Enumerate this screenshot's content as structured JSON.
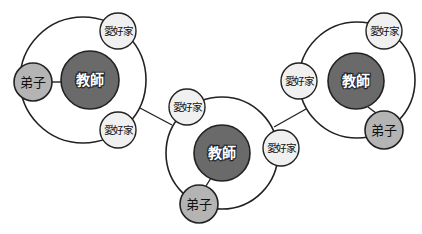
{
  "diagram": {
    "type": "relationship-network",
    "labels": {
      "teacher": "教師",
      "disciple": "弟子",
      "amateur": "愛好家"
    },
    "colors": {
      "teacher_fill": "#6a6a6a",
      "disciple_fill": "#b4b4b4",
      "amateur_fill": "#f0f0f0",
      "stroke": "#222222"
    },
    "groups": [
      {
        "id": "left",
        "ring": {
          "cx": 83,
          "cy": 80,
          "r": 63
        },
        "teacher": {
          "cx": 90,
          "cy": 80,
          "r": 29,
          "label": "教師"
        },
        "disciple": {
          "cx": 33,
          "cy": 82,
          "r": 19,
          "label": "弟子"
        },
        "amateurs": [
          {
            "cx": 118,
            "cy": 31,
            "r": 18,
            "label": "愛好家"
          },
          {
            "cx": 118,
            "cy": 130,
            "r": 18,
            "label": "愛好家"
          }
        ]
      },
      {
        "id": "middle",
        "ring": {
          "cx": 222,
          "cy": 153,
          "r": 56
        },
        "teacher": {
          "cx": 222,
          "cy": 153,
          "r": 28,
          "label": "教師"
        },
        "disciple": {
          "cx": 199,
          "cy": 204,
          "r": 19,
          "label": "弟子"
        },
        "amateurs": [
          {
            "cx": 187,
            "cy": 107,
            "r": 18,
            "label": "愛好家"
          },
          {
            "cx": 281,
            "cy": 148,
            "r": 18,
            "label": "愛好家"
          }
        ]
      },
      {
        "id": "right",
        "ring": {
          "cx": 357,
          "cy": 80,
          "r": 58
        },
        "teacher": {
          "cx": 356,
          "cy": 81,
          "r": 28,
          "label": "教師"
        },
        "disciple": {
          "cx": 384,
          "cy": 130,
          "r": 19,
          "label": "弟子"
        },
        "amateurs": [
          {
            "cx": 299,
            "cy": 81,
            "r": 18,
            "label": "愛好家"
          },
          {
            "cx": 384,
            "cy": 31,
            "r": 18,
            "label": "愛好家"
          }
        ]
      }
    ],
    "connectors": [
      {
        "from": "left",
        "to": "middle",
        "x1": 140,
        "y1": 108,
        "x2": 172,
        "y2": 125
      },
      {
        "from": "middle",
        "to": "right",
        "x1": 274,
        "y1": 127,
        "x2": 306,
        "y2": 109
      }
    ],
    "spokes": [
      {
        "group": "left",
        "x1": 52,
        "y1": 82,
        "x2": 62,
        "y2": 82
      },
      {
        "group": "middle",
        "x1": 206,
        "y1": 186,
        "x2": 211,
        "y2": 178
      },
      {
        "group": "right",
        "x1": 368,
        "y1": 107,
        "x2": 376,
        "y2": 113
      }
    ]
  }
}
